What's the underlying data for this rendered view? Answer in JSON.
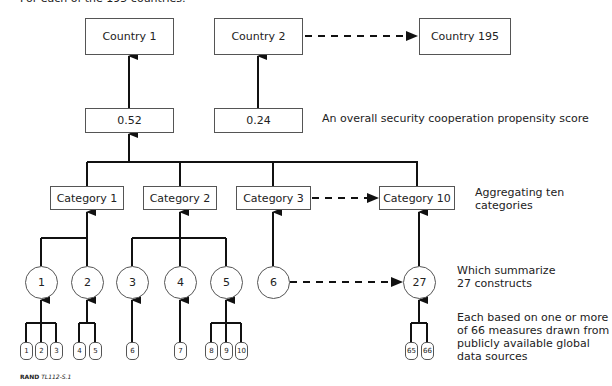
{
  "header": {
    "text": "For each of the 195 countries:"
  },
  "countries": [
    {
      "label": "Country 1"
    },
    {
      "label": "Country 2"
    },
    {
      "label": "Country 195"
    }
  ],
  "scores": [
    {
      "value": "0.52"
    },
    {
      "value": "0.24"
    }
  ],
  "categories": [
    {
      "label": "Category 1"
    },
    {
      "label": "Category 2"
    },
    {
      "label": "Category 3"
    },
    {
      "label": "Category 10"
    }
  ],
  "constructs": [
    {
      "label": "1"
    },
    {
      "label": "2"
    },
    {
      "label": "3"
    },
    {
      "label": "4"
    },
    {
      "label": "5"
    },
    {
      "label": "6"
    },
    {
      "label": "27"
    }
  ],
  "measures": [
    {
      "label": "1"
    },
    {
      "label": "2"
    },
    {
      "label": "3"
    },
    {
      "label": "4"
    },
    {
      "label": "5"
    },
    {
      "label": "6"
    },
    {
      "label": "7"
    },
    {
      "label": "8"
    },
    {
      "label": "9"
    },
    {
      "label": "10"
    },
    {
      "label": "65"
    },
    {
      "label": "66"
    }
  ],
  "annotations": {
    "score": "An overall security cooperation propensity score",
    "categories_line1": "Aggregating ten",
    "categories_line2": "categories",
    "constructs_line1": "Which summarize",
    "constructs_line2": "27 constructs",
    "measures_line1": "Each based on one or more",
    "measures_line2": "of 66 measures drawn from",
    "measures_line3": "publicly available global",
    "measures_line4": "data sources"
  },
  "credit": {
    "org": "RAND",
    "id": "TL112-S.1"
  },
  "colors": {
    "line": "#111111",
    "box_border": "#555555",
    "text": "#222222"
  }
}
